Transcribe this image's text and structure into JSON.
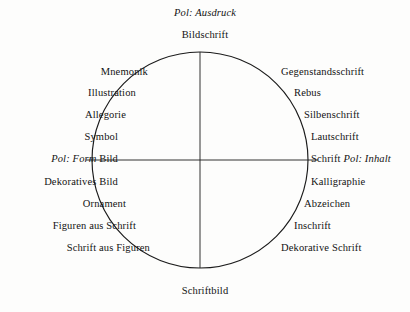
{
  "diagram": {
    "geometry": {
      "center_x": 200,
      "center_y": 160,
      "radius": 108
    },
    "stroke_color": "#1b1b1b",
    "background_color": "#fdfdfc"
  },
  "axes": {
    "top": {
      "pole_caption": "Pol: Ausdruck",
      "term": "Bildschrift"
    },
    "bottom": {
      "pole_caption": "",
      "term": "Schriftbild"
    },
    "left": {
      "pole_caption": "Pol: Form",
      "term": "Bild"
    },
    "right": {
      "pole_caption": "Pol: Inhalt",
      "term": "Schrift"
    }
  },
  "left_column": [
    {
      "text": "Mnemonik",
      "x": 148,
      "y": 72
    },
    {
      "text": "Illustration",
      "x": 136,
      "y": 93
    },
    {
      "text": "Allegorie",
      "x": 126,
      "y": 115
    },
    {
      "text": "Symbol",
      "x": 118,
      "y": 137
    },
    {
      "text": "Dekoratives Bild",
      "x": 118,
      "y": 182
    },
    {
      "text": "Ornament",
      "x": 126,
      "y": 204
    },
    {
      "text": "Figuren aus Schrift",
      "x": 136,
      "y": 226
    },
    {
      "text": "Schrift aus Figuren",
      "x": 150,
      "y": 248
    }
  ],
  "right_column": [
    {
      "text": "Gegenstandsschrift",
      "x": 281,
      "y": 72
    },
    {
      "text": "Rebus",
      "x": 294,
      "y": 93
    },
    {
      "text": "Silbenschrift",
      "x": 304,
      "y": 115
    },
    {
      "text": "Lautschrift",
      "x": 311,
      "y": 137
    },
    {
      "text": "Kalligraphie",
      "x": 311,
      "y": 182
    },
    {
      "text": "Abzeichen",
      "x": 304,
      "y": 204
    },
    {
      "text": "Inschrift",
      "x": 294,
      "y": 226
    },
    {
      "text": "Dekorative Schrift",
      "x": 281,
      "y": 248
    }
  ],
  "pole_labels": {
    "top_caption_x": 205,
    "top_caption_y": 13,
    "top_term_x": 205,
    "top_term_y": 35,
    "bottom_term_x": 205,
    "bottom_term_y": 291,
    "left_x": 118,
    "left_y": 159,
    "right_x": 311,
    "right_y": 159
  }
}
